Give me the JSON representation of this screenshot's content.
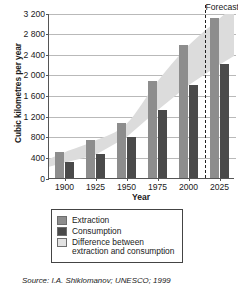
{
  "chart_data": {
    "type": "bar",
    "title": "",
    "xlabel": "Year",
    "ylabel": "Cubic kilometres per year",
    "categories": [
      "1900",
      "1925",
      "1950",
      "1975",
      "2000",
      "2025"
    ],
    "series": [
      {
        "name": "Extraction",
        "key": "extraction",
        "color": "#8d8d8d",
        "values": [
          500,
          730,
          1050,
          1870,
          2570,
          3100
        ]
      },
      {
        "name": "Consumption",
        "key": "consumption",
        "color": "#4a4a4a",
        "values": [
          300,
          450,
          790,
          1310,
          1800,
          2200
        ]
      }
    ],
    "band": {
      "name": "Difference between extraction and consumption",
      "color": "#dcdcdc",
      "upper": [
        500,
        730,
        1050,
        1870,
        2570,
        3100
      ],
      "lower": [
        300,
        450,
        790,
        1310,
        1800,
        2200
      ]
    },
    "ylim": [
      0,
      3200
    ],
    "ytick_step": 400,
    "ytick_labels": [
      "3 200",
      "2 800",
      "2 400",
      "2 000",
      "1 600",
      "1 200",
      "800",
      "400",
      "0"
    ],
    "ytick_values": [
      3200,
      2800,
      2400,
      2000,
      1600,
      1200,
      800,
      400,
      0
    ],
    "grid": true,
    "legend_position": "below-plot",
    "annotations": [
      {
        "name": "forecast",
        "label": "Forecast",
        "x_value": 2015,
        "style": "vertical-dashed-line"
      }
    ]
  },
  "legend": {
    "items": [
      {
        "label": "Extraction",
        "color": "#8d8d8d"
      },
      {
        "label": "Consumption",
        "color": "#4a4a4a"
      },
      {
        "label": "Difference between extraction and consumption",
        "color": "#e2e2e2"
      }
    ]
  },
  "source": {
    "text": "Source: I.A. Shiklomanov; UNESCO; 1999"
  }
}
